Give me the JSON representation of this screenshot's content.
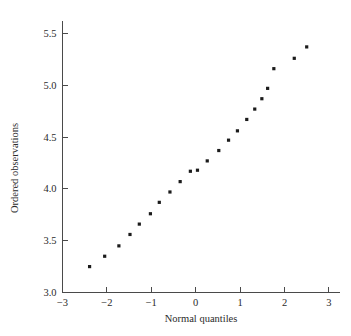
{
  "chart_data": {
    "type": "scatter",
    "title": "",
    "xlabel": "Normal quantiles",
    "ylabel": "Ordered observations",
    "xlim": [
      -3,
      3.25
    ],
    "ylim": [
      3.0,
      5.62
    ],
    "grid": false,
    "legend": null,
    "xticks": [
      -3,
      -2,
      -1,
      0,
      1,
      2,
      3
    ],
    "xticklabels": [
      "−3",
      "−2",
      "−1",
      "0",
      "1",
      "2",
      "3"
    ],
    "yticks": [
      3.0,
      3.5,
      4.0,
      4.5,
      5.0,
      5.5
    ],
    "yticklabels": [
      "3.0",
      "3.5",
      "4.0",
      "4.5",
      "5.0",
      "5.5"
    ],
    "marker": "filled-square",
    "marker_color": "#1b1b1b",
    "marker_size": 3.2,
    "x": [
      -2.39,
      -2.05,
      -1.73,
      -1.48,
      -1.27,
      -1.02,
      -0.82,
      -0.58,
      -0.35,
      -0.12,
      0.04,
      0.26,
      0.52,
      0.74,
      0.94,
      1.15,
      1.33,
      1.49,
      1.62,
      1.76,
      2.22,
      2.5
    ],
    "y": [
      3.25,
      3.35,
      3.45,
      3.56,
      3.66,
      3.76,
      3.87,
      3.97,
      4.07,
      4.17,
      4.18,
      4.27,
      4.37,
      4.47,
      4.56,
      4.67,
      4.77,
      4.87,
      4.97,
      5.16,
      5.26,
      5.37
    ],
    "n_points": 22
  },
  "axes": {
    "x_title": "Normal quantiles",
    "y_title": "Ordered observations"
  }
}
